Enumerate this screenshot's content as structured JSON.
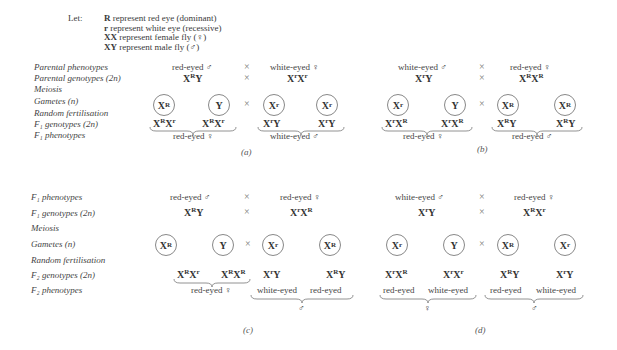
{
  "legend": {
    "let": "Let:",
    "lines": [
      {
        "sym": "R",
        "text": " represent red eye (dominant)"
      },
      {
        "sym": "r",
        "text": " represent white eye (recessive)"
      },
      {
        "sym": "XX",
        "text": " represent female fly (♀)"
      },
      {
        "sym": "XY",
        "text": " represent male fly (♂)"
      }
    ]
  },
  "top_labels": [
    "Parental phenotypes",
    "Parental genotypes (2n)",
    "Meiosis",
    "Gametes (n)",
    "Random fertilisation",
    "F₁ genotypes (2n)",
    "F₁ phenotypes"
  ],
  "bottom_labels": [
    "F₁ phenotypes",
    "F₁ genotypes (2n)",
    "Meiosis",
    "Gametes (n)",
    "Random fertilisation",
    "F₂ genotypes (2n)",
    "F₂ phenotypes"
  ],
  "symbols": {
    "cross": "×",
    "male": "♂",
    "female": "♀"
  },
  "panels": {
    "a": {
      "caption": "(a)",
      "parent1_pheno": "red-eyed ♂",
      "parent2_pheno": "white-eyed ♀",
      "parent1_geno": [
        "X",
        "R",
        "Y",
        ""
      ],
      "parent2_geno": [
        "X",
        "r",
        "X",
        "r"
      ],
      "gametes": [
        [
          "X",
          "R"
        ],
        [
          "Y",
          ""
        ],
        [
          "X",
          "r"
        ],
        [
          "X",
          "r"
        ]
      ],
      "offspring": [
        [
          "X",
          "R",
          "X",
          "r"
        ],
        [
          "X",
          "R",
          "X",
          "r"
        ],
        [
          "X",
          "r",
          "Y",
          ""
        ],
        [
          "X",
          "r",
          "Y",
          ""
        ]
      ],
      "pheno_groups": [
        "red-eyed ♀",
        "white-eyed ♂"
      ]
    },
    "b": {
      "caption": "(b)",
      "parent1_pheno": "white-eyed ♂",
      "parent2_pheno": "red-eyed ♀",
      "parent1_geno": [
        "X",
        "r",
        "Y",
        ""
      ],
      "parent2_geno": [
        "X",
        "R",
        "X",
        "R"
      ],
      "gametes": [
        [
          "X",
          "r"
        ],
        [
          "Y",
          ""
        ],
        [
          "X",
          "R"
        ],
        [
          "X",
          "R"
        ]
      ],
      "offspring": [
        [
          "X",
          "r",
          "X",
          "R"
        ],
        [
          "X",
          "r",
          "X",
          "R"
        ],
        [
          "X",
          "R",
          "Y",
          ""
        ],
        [
          "X",
          "R",
          "Y",
          ""
        ]
      ],
      "pheno_groups": [
        "red-eyed ♀",
        "red-eyed ♂"
      ]
    },
    "c": {
      "caption": "(c)",
      "parent1_pheno": "red-eyed ♂",
      "parent2_pheno": "red-eyed ♀",
      "parent1_geno": [
        "X",
        "R",
        "Y",
        ""
      ],
      "parent2_geno": [
        "X",
        "r",
        "X",
        "R"
      ],
      "gametes": [
        [
          "X",
          "R"
        ],
        [
          "Y",
          ""
        ],
        [
          "X",
          "r"
        ],
        [
          "X",
          "R"
        ]
      ],
      "offspring": [
        [
          "X",
          "R",
          "X",
          "r"
        ],
        [
          "X",
          "R",
          "X",
          "R"
        ],
        [
          "X",
          "r",
          "Y",
          ""
        ],
        [
          "X",
          "R",
          "Y",
          ""
        ]
      ],
      "pheno_groups": [
        "red-eyed ♀"
      ],
      "male_phenos": [
        "white-eyed",
        "red-eyed"
      ],
      "male_sex": "♂"
    },
    "d": {
      "caption": "(d)",
      "parent1_pheno": "white-eyed ♂",
      "parent2_pheno": "red-eyed ♀",
      "parent1_geno": [
        "X",
        "r",
        "Y",
        ""
      ],
      "parent2_geno": [
        "X",
        "R",
        "X",
        "r"
      ],
      "gametes": [
        [
          "X",
          "r"
        ],
        [
          "Y",
          ""
        ],
        [
          "X",
          "R"
        ],
        [
          "X",
          "r"
        ]
      ],
      "offspring": [
        [
          "X",
          "r",
          "X",
          "R"
        ],
        [
          "X",
          "r",
          "X",
          "r"
        ],
        [
          "X",
          "R",
          "Y",
          ""
        ],
        [
          "X",
          "r",
          "Y",
          ""
        ]
      ],
      "female_phenos": [
        "red-eyed",
        "white-eyed"
      ],
      "female_sex": "♀",
      "male_phenos": [
        "red-eyed",
        "white-eyed"
      ],
      "male_sex": "♂"
    }
  }
}
